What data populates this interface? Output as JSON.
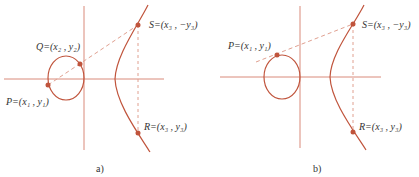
{
  "colors": {
    "curve": "#c0543c",
    "axis": "#d98a7a",
    "dash": "#e0a090",
    "point": "#c0543c",
    "text": "#333333"
  },
  "panel_a": {
    "caption": "a)",
    "points": {
      "P": "P=(x₁ , y₁)",
      "Q": "Q=(x₂ , y₂)",
      "S": "S=(x₃ , −y₃)",
      "R": "R=(x₃ , y₃)"
    }
  },
  "panel_b": {
    "caption": "b)",
    "points": {
      "P": "P=(x₁ , y₁)",
      "S": "S=(x₃ , −y₃)",
      "R": "R=(x₃ , y₃)"
    }
  }
}
